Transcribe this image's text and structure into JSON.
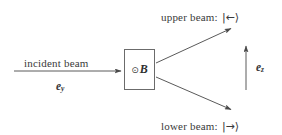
{
  "figure": {
    "kind": "beam-splitting-diagram",
    "stroke_color": "#5a5a5a",
    "text_color": "#3a3a3a",
    "box_border_color": "#6b6b6b",
    "background": "#ffffff"
  },
  "labels": {
    "upper_beam_text": "upper beam:",
    "upper_beam_ket": "|←⟩",
    "lower_beam_text": "lower beam:",
    "lower_beam_ket": "|→⟩",
    "incident_beam_text": "incident beam",
    "incident_direction_symbol": "e",
    "incident_direction_subscript": "y",
    "axis_symbol": "e",
    "axis_subscript": "z"
  },
  "field_box": {
    "dot_symbol": "⊙",
    "field_symbol": "B"
  },
  "geometry": {
    "incident_arrow": {
      "x1": 14,
      "y1": 71,
      "x2": 122,
      "y2": 71
    },
    "upper_arrow": {
      "x1": 156,
      "y1": 63,
      "x2": 232,
      "y2": 28
    },
    "lower_arrow": {
      "x1": 156,
      "y1": 77,
      "x2": 232,
      "y2": 110
    },
    "axis_arrow": {
      "x1": 246,
      "y1": 90,
      "x2": 246,
      "y2": 45
    },
    "box": {
      "x": 124,
      "y": 49,
      "width": 31,
      "height": 41
    }
  }
}
